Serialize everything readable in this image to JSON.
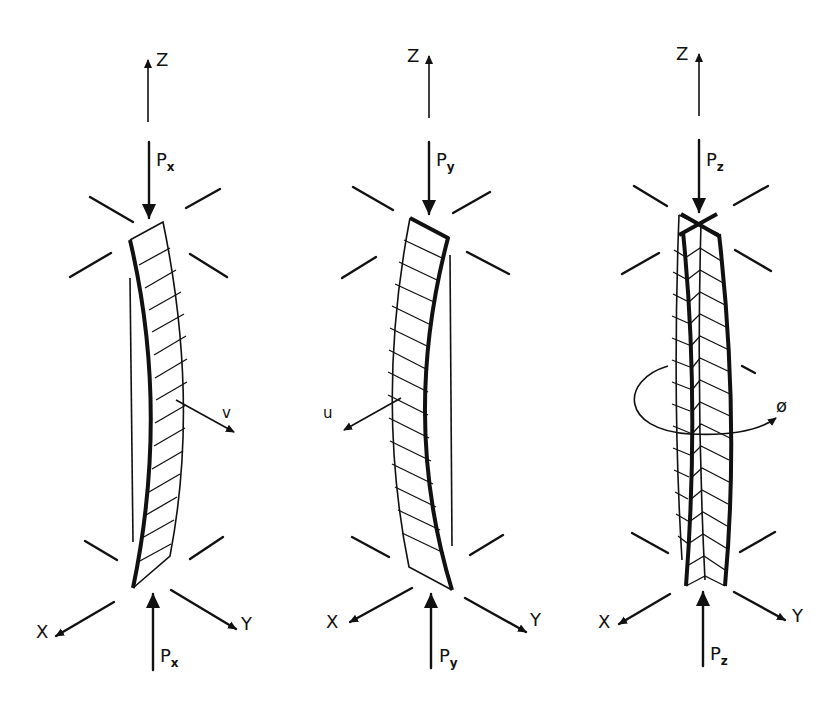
{
  "diagram": {
    "panels": [
      {
        "id": "flexural-x",
        "axis_up": "Z",
        "axis_left": "X",
        "axis_right": "Y",
        "load_top": {
          "main": "P",
          "sub": "x"
        },
        "load_bottom": {
          "main": "P",
          "sub": "x"
        },
        "displacement": "v"
      },
      {
        "id": "flexural-y",
        "axis_up": "Z",
        "axis_left": "X",
        "axis_right": "Y",
        "load_top": {
          "main": "P",
          "sub": "y"
        },
        "load_bottom": {
          "main": "P",
          "sub": "y"
        },
        "displacement": "u"
      },
      {
        "id": "torsional-z",
        "axis_up": "Z",
        "axis_left": "X",
        "axis_right": "Y",
        "load_top": {
          "main": "P",
          "sub": "z"
        },
        "load_bottom": {
          "main": "P",
          "sub": "z"
        },
        "displacement": "ø"
      }
    ]
  }
}
